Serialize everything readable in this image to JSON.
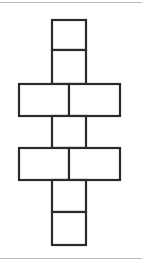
{
  "page": {
    "background_color": "#ffffff",
    "width": 142,
    "height": 268
  },
  "rules": {
    "top_rule_color": "#b9b9b9",
    "bottom_rule_color": "#b9b9b9"
  },
  "figure": {
    "name": "cube-net-diagram",
    "stroke_color": "#2b2b2b",
    "fill_color": "#ffffff",
    "stroke_width": 2.2,
    "cells": [
      {
        "id": "top-square-1",
        "label": "",
        "x": 52,
        "y": 20,
        "w": 34,
        "h": 30
      },
      {
        "id": "top-square-2",
        "label": "",
        "x": 52,
        "y": 50,
        "w": 34,
        "h": 34
      },
      {
        "id": "row1-left",
        "label": "",
        "x": 19,
        "y": 84,
        "w": 50,
        "h": 32
      },
      {
        "id": "row1-right",
        "label": "",
        "x": 69,
        "y": 84,
        "w": 51,
        "h": 32
      },
      {
        "id": "middle-square",
        "label": "",
        "x": 52,
        "y": 116,
        "w": 34,
        "h": 32
      },
      {
        "id": "row2-left",
        "label": "",
        "x": 19,
        "y": 148,
        "w": 50,
        "h": 32
      },
      {
        "id": "row2-right",
        "label": "",
        "x": 69,
        "y": 148,
        "w": 51,
        "h": 32
      },
      {
        "id": "bottom-square-1",
        "label": "",
        "x": 52,
        "y": 180,
        "w": 34,
        "h": 32
      },
      {
        "id": "bottom-square-2",
        "label": "",
        "x": 52,
        "y": 212,
        "w": 34,
        "h": 33
      }
    ]
  }
}
